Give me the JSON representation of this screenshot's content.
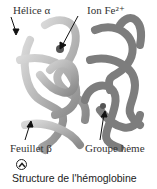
{
  "figure": {
    "labels": {
      "helix": "Hélice α",
      "iron": "Ion Fe²⁺",
      "sheet": "Feuillet β",
      "heme": "Groupe hème"
    },
    "toggle_icon": "chevron-up-circle-icon",
    "caption": "Structure de l'hémoglobine",
    "colors": {
      "protein_light": "#b8b8b8",
      "protein_dark": "#7a7a7a",
      "text": "#333333"
    }
  }
}
